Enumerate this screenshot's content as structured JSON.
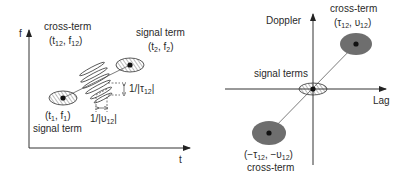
{
  "left_panel": {
    "title": "time-frequency plane (Wigner distribution)",
    "y_axis_label": "f",
    "x_axis_label": "t",
    "cross_term": {
      "label": "cross-term",
      "coords": "(t12, f12)",
      "coord_parts": [
        "(t",
        "12",
        ", f",
        "12",
        ")"
      ]
    },
    "signal_term_2": {
      "label": "signal term",
      "coord_parts": [
        "(t",
        "2",
        ", f",
        "2",
        ")"
      ]
    },
    "signal_term_1": {
      "label": "signal term",
      "coord_parts": [
        "(t",
        "1",
        ", f",
        "1",
        ")"
      ]
    },
    "tau_spacing": {
      "parts": [
        "1/|τ",
        "12",
        "|"
      ]
    },
    "nu_spacing": {
      "parts": [
        "1/|υ",
        "12",
        "|"
      ]
    }
  },
  "right_panel": {
    "title": "ambiguity plane",
    "y_axis_label": "Doppler",
    "x_axis_label": "Lag",
    "signal_terms_label": "signal terms",
    "cross_term_top": {
      "label": "cross-term",
      "coord_parts": [
        "(τ",
        "12",
        ", υ",
        "12",
        ")"
      ]
    },
    "cross_term_bottom": {
      "label": "cross-term",
      "coord_parts": [
        "(−τ",
        "12",
        ", −υ",
        "12",
        ")"
      ]
    }
  },
  "colors": {
    "ink": "#2a2a2a",
    "cross_term_fill": "#6e6e6e",
    "hatch": "#555555",
    "background": "#ffffff"
  }
}
